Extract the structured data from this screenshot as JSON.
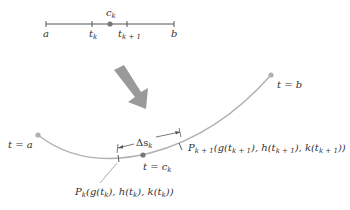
{
  "number_line": {
    "labels": {
      "a": "a",
      "t_k": "t",
      "t_k_sub": "k",
      "c_k": "c",
      "c_k_sub": "k",
      "t_k1": "t",
      "t_k1_sub": "k + 1",
      "b": "b"
    }
  },
  "curve": {
    "start_label": "t = a",
    "end_label": "t = b",
    "point_label": "t = c",
    "point_label_sub": "k",
    "arc_label": "Δs",
    "arc_label_sub": "k",
    "pk_label": "P",
    "pk_sub": "k",
    "pk_coords": "(g(t",
    "pk_full": "(g(t_k), h(t_k), k(t_k))",
    "pk1_label": "P",
    "pk1_sub": "k + 1",
    "pk1_full": "(g(t_k+1), h(t_k+1), k(t_k+1))"
  },
  "colors": {
    "curve": "#b0b0b0",
    "arrow": "#9a9a9a",
    "line": "#555555",
    "dot": "#777777"
  }
}
